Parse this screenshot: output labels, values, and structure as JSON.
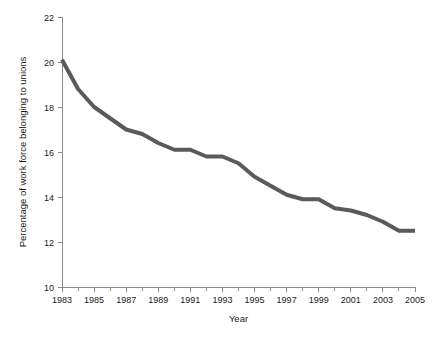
{
  "chart_data": {
    "type": "line",
    "title": "",
    "xlabel": "Year",
    "ylabel": "Percentage of work force belonging to unions",
    "xlim": [
      1983,
      2005
    ],
    "ylim": [
      10,
      22
    ],
    "grid": false,
    "legend": false,
    "line_color": "#5a5a5a",
    "axis_color": "#8a8a8a",
    "x": [
      1983,
      1984,
      1985,
      1986,
      1987,
      1988,
      1989,
      1990,
      1991,
      1992,
      1993,
      1994,
      1995,
      1996,
      1997,
      1998,
      1999,
      2000,
      2001,
      2002,
      2003,
      2004,
      2005
    ],
    "values": [
      20.1,
      18.8,
      18.0,
      17.5,
      17.0,
      16.8,
      16.4,
      16.1,
      16.1,
      15.8,
      15.8,
      15.5,
      14.9,
      14.5,
      14.1,
      13.9,
      13.9,
      13.5,
      13.4,
      13.2,
      12.9,
      12.5,
      12.5
    ],
    "series": [
      {
        "name": "Union membership",
        "values": [
          20.1,
          18.8,
          18.0,
          17.5,
          17.0,
          16.8,
          16.4,
          16.1,
          16.1,
          15.8,
          15.8,
          15.5,
          14.9,
          14.5,
          14.1,
          13.9,
          13.9,
          13.5,
          13.4,
          13.2,
          12.9,
          12.5,
          12.5
        ]
      }
    ],
    "x_tick_values": [
      1983,
      1984,
      1985,
      1986,
      1987,
      1988,
      1989,
      1990,
      1991,
      1992,
      1993,
      1994,
      1995,
      1996,
      1997,
      1998,
      1999,
      2000,
      2001,
      2002,
      2003,
      2004,
      2005
    ],
    "x_tick_labels": [
      "1983",
      "",
      "1985",
      "",
      "1987",
      "",
      "1989",
      "",
      "1991",
      "",
      "1993",
      "",
      "1995",
      "",
      "1997",
      "",
      "1999",
      "",
      "2001",
      "",
      "2003",
      "",
      "2005"
    ],
    "y_tick_values": [
      10,
      12,
      14,
      16,
      18,
      20,
      22
    ],
    "y_tick_labels": [
      "10",
      "12",
      "14",
      "16",
      "18",
      "20",
      "22"
    ]
  }
}
